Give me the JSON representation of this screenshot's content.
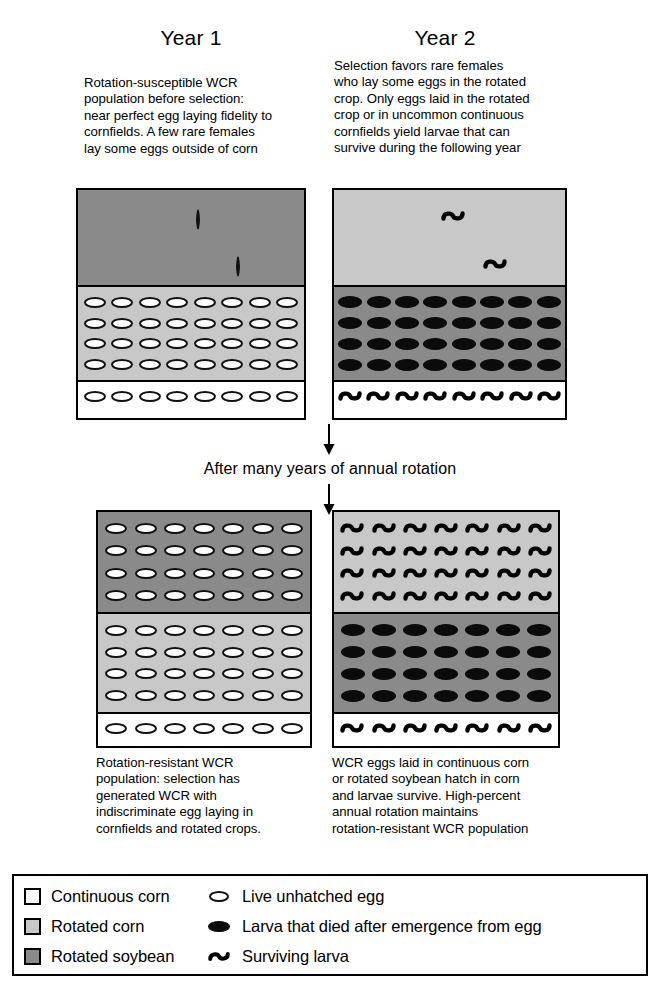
{
  "columns": {
    "year1": {
      "title": "Year 1",
      "top_text": "Rotation-susceptible WCR\npopulation before selection:\nnear perfect egg laying fidelity to\ncornfields. A few rare females\nlay some eggs outside of corn",
      "bottom_text": "Rotation-resistant WCR\npopulation: selection has\ngenerated WCR with\nindiscriminate egg laying in\ncornfields and rotated crops."
    },
    "year2": {
      "title": "Year 2",
      "top_text": "Selection favors rare females\nwho lay some eggs in the rotated\ncrop. Only eggs laid in the rotated\ncrop or in uncommon continuous\ncornfields yield larvae that can\nsurvive during the following year",
      "bottom_text": "WCR eggs laid in continuous corn\nor rotated soybean hatch in corn\nand larvae survive. High-percent\nannual rotation maintains\nrotation-resistant WCR population"
    }
  },
  "middle_caption": "After many years of annual rotation",
  "legend": {
    "fields": [
      {
        "label": "Continuous corn",
        "swatch": "white"
      },
      {
        "label": "Rotated corn",
        "swatch": "light"
      },
      {
        "label": "Rotated soybean",
        "swatch": "dark"
      }
    ],
    "markers": [
      {
        "label": "Live unhatched egg",
        "icon": "egg-icon"
      },
      {
        "label": "Larva that died after emergence from egg",
        "icon": "dead-larva-icon"
      },
      {
        "label": "Surviving larva",
        "icon": "surviving-larva-icon"
      }
    ]
  },
  "colors": {
    "continuous_corn": "#ffffff",
    "rotated_corn": "#c8c8c8",
    "rotated_soybean": "#8a8a8a",
    "outline": "#000000"
  },
  "panels": {
    "year1_top": {
      "bands": [
        {
          "field": "Rotated soybean",
          "shade": "dark",
          "height": 95,
          "marker": "egg-icon",
          "layout": "scatter",
          "count": 2,
          "positions": [
            {
              "x": 52,
              "y": 22
            },
            {
              "x": 70,
              "y": 72
            }
          ]
        },
        {
          "field": "Rotated corn",
          "shade": "light",
          "height": 95,
          "marker": "egg-icon",
          "layout": "grid",
          "rows": 4,
          "cols": 8
        },
        {
          "field": "Continuous corn",
          "shade": "white",
          "height": 30,
          "marker": "egg-icon",
          "layout": "grid",
          "rows": 1,
          "cols": 8
        }
      ]
    },
    "year2_top": {
      "bands": [
        {
          "field": "Rotated corn",
          "shade": "light",
          "height": 95,
          "marker": "surviving-larva-icon",
          "layout": "scatter",
          "count": 2,
          "positions": [
            {
              "x": 46,
              "y": 20
            },
            {
              "x": 64,
              "y": 70
            }
          ]
        },
        {
          "field": "Rotated soybean",
          "shade": "dark",
          "height": 95,
          "marker": "dead-larva-icon",
          "layout": "grid",
          "rows": 4,
          "cols": 8
        },
        {
          "field": "Continuous corn",
          "shade": "white",
          "height": 30,
          "marker": "surviving-larva-icon",
          "layout": "grid",
          "rows": 1,
          "cols": 8
        }
      ]
    },
    "year1_bottom": {
      "bands": [
        {
          "field": "Rotated soybean",
          "shade": "dark",
          "height": 100,
          "marker": "egg-icon",
          "layout": "grid",
          "rows": 4,
          "cols": 7
        },
        {
          "field": "Rotated corn",
          "shade": "light",
          "height": 100,
          "marker": "egg-icon",
          "layout": "grid",
          "rows": 4,
          "cols": 7
        },
        {
          "field": "Continuous corn",
          "shade": "white",
          "height": 30,
          "marker": "egg-icon",
          "layout": "grid",
          "rows": 1,
          "cols": 7
        }
      ]
    },
    "year2_bottom": {
      "bands": [
        {
          "field": "Rotated corn",
          "shade": "light",
          "height": 100,
          "marker": "surviving-larva-icon",
          "layout": "grid",
          "rows": 4,
          "cols": 7
        },
        {
          "field": "Rotated soybean",
          "shade": "dark",
          "height": 100,
          "marker": "dead-larva-icon",
          "layout": "grid",
          "rows": 4,
          "cols": 7
        },
        {
          "field": "Continuous corn",
          "shade": "white",
          "height": 30,
          "marker": "surviving-larva-icon",
          "layout": "grid",
          "rows": 1,
          "cols": 7
        }
      ]
    }
  }
}
